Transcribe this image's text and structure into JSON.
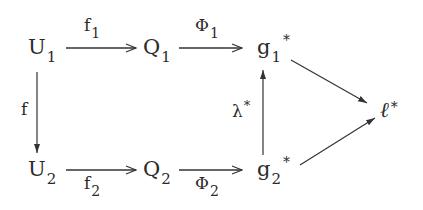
{
  "diagram": {
    "type": "commutative-diagram",
    "nodes": {
      "U1": {
        "base": "U",
        "sub": "1",
        "sup": ""
      },
      "Q1": {
        "base": "Q",
        "sub": "1",
        "sup": ""
      },
      "g1": {
        "base": "g",
        "sub": "1",
        "sup": "*"
      },
      "U2": {
        "base": "U",
        "sub": "2",
        "sup": ""
      },
      "Q2": {
        "base": "Q",
        "sub": "2",
        "sup": ""
      },
      "g2": {
        "base": "g",
        "sub": "2",
        "sup": "*"
      },
      "l": {
        "base": "ℓ",
        "sub": "",
        "sup": "*"
      }
    },
    "arrows": {
      "f1": {
        "from": "U1",
        "to": "Q1",
        "base": "f",
        "sub": "1",
        "sup": "",
        "position": "above"
      },
      "Phi1": {
        "from": "Q1",
        "to": "g1",
        "base": "Φ",
        "sub": "1",
        "sup": "",
        "position": "above"
      },
      "f": {
        "from": "U1",
        "to": "U2",
        "base": "f",
        "sub": "",
        "sup": "",
        "position": "left"
      },
      "f2": {
        "from": "U2",
        "to": "Q2",
        "base": "f",
        "sub": "2",
        "sup": "",
        "position": "below"
      },
      "Phi2": {
        "from": "Q2",
        "to": "g2",
        "base": "Φ",
        "sub": "2",
        "sup": "",
        "position": "below"
      },
      "lambda": {
        "from": "g2",
        "to": "g1",
        "base": "λ",
        "sub": "",
        "sup": "*",
        "position": "left"
      },
      "g1_l": {
        "from": "g1",
        "to": "l",
        "base": "",
        "sub": "",
        "sup": "",
        "position": "none"
      },
      "g2_l": {
        "from": "g2",
        "to": "l",
        "base": "",
        "sub": "",
        "sup": "",
        "position": "none"
      }
    },
    "stroke_color": "#333333"
  }
}
